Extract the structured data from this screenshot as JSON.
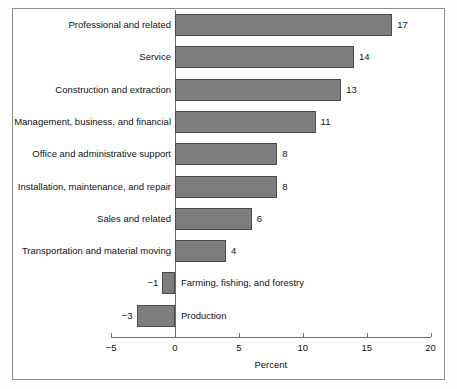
{
  "chart_data": {
    "type": "bar",
    "orientation": "horizontal",
    "title": "",
    "xlabel": "Percent",
    "ylabel": "",
    "xlim": [
      -5,
      20
    ],
    "xticks": [
      -5,
      0,
      5,
      10,
      15,
      20
    ],
    "xtick_labels": [
      "−5",
      "0",
      "5",
      "10",
      "15",
      "20"
    ],
    "grid": false,
    "legend": null,
    "bar_color": "#7d7d7d",
    "bar_edge_color": "#4a4a4a",
    "categories": [
      "Professional and related",
      "Service",
      "Construction and extraction",
      "Management, business, and financial",
      "Office and administrative support",
      "Installation, maintenance, and repair",
      "Sales and related",
      "Transportation and material moving",
      "Farming, fishing, and forestry",
      "Production"
    ],
    "values": [
      17,
      14,
      13,
      11,
      8,
      8,
      6,
      4,
      -1,
      -3
    ],
    "value_labels": [
      "17",
      "14",
      "13",
      "11",
      "8",
      "8",
      "6",
      "4",
      "−1",
      "−3"
    ]
  }
}
